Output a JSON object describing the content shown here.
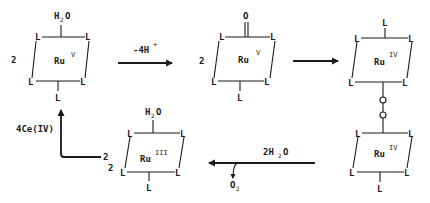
{
  "diagram": {
    "ligand": "L",
    "complexes": [
      {
        "id": "ru-v-aqua",
        "coefficient": "2",
        "metal": "Ru",
        "oxidation_state": "V",
        "axial_top": "H2O",
        "axial_top_main": "H",
        "axial_top_sub": "2",
        "axial_top_end": "O",
        "axial_bottom": "L"
      },
      {
        "id": "ru-v-oxo",
        "coefficient": "2",
        "metal": "Ru",
        "oxidation_state": "V",
        "axial_top": "O",
        "axial_bottom": "L"
      },
      {
        "id": "ru-iv-dimer-top",
        "metal": "Ru",
        "oxidation_state": "IV",
        "axial_top": "L"
      },
      {
        "id": "ru-iv-dimer-bottom",
        "metal": "Ru",
        "oxidation_state": "IV",
        "axial_bottom": "L"
      },
      {
        "id": "ru-iii-aqua",
        "coefficient": "2",
        "metal": "Ru",
        "oxidation_state": "III",
        "axial_top": "H2O",
        "axial_top_main": "H",
        "axial_top_sub": "2",
        "axial_top_end": "O",
        "axial_bottom": "L"
      }
    ],
    "bridge": {
      "atoms": [
        "O",
        "O"
      ]
    },
    "arrows": [
      {
        "id": "deprotonation",
        "label_main": "-4H",
        "label_sup": "+"
      },
      {
        "id": "dimerization",
        "label_main": ""
      },
      {
        "id": "water-addition",
        "label_main": "2H",
        "label_sub": "2",
        "label_end": "O",
        "byproduct_main": "O",
        "byproduct_sub": "2"
      },
      {
        "id": "oxidation",
        "label_main": "4Ce(IV)",
        "coefficient": "2"
      }
    ]
  }
}
